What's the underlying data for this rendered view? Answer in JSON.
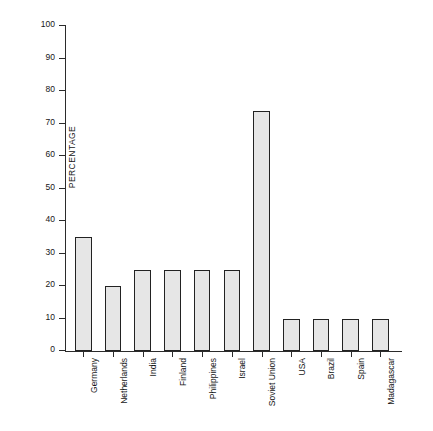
{
  "chart_data": {
    "type": "bar",
    "title": "",
    "xlabel": "",
    "ylabel": "PERCENTAGE",
    "ylim": [
      0,
      100
    ],
    "yticks": [
      0,
      10,
      20,
      30,
      40,
      50,
      60,
      70,
      80,
      90,
      100
    ],
    "grid": false,
    "legend": null,
    "categories": [
      "Germany",
      "Netherlands",
      "India",
      "Finland",
      "Philippines",
      "Israel",
      "Soviet Union",
      "USA",
      "Brazil",
      "Spain",
      "Madagascar"
    ],
    "values": [
      35,
      20,
      25,
      25,
      25,
      25,
      74,
      10,
      10,
      10,
      10
    ],
    "bar_fill_color": "#e6e6e6",
    "bar_edge_color": "#222222",
    "axis_color": "#2b2b2b"
  },
  "caption": ""
}
